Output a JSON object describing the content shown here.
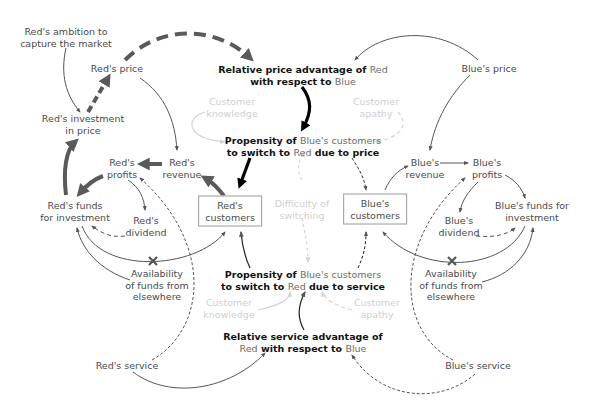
{
  "diagram": {
    "type": "causal-loop-diagram",
    "colors": {
      "text": "#4a4a4a",
      "bold_text": "#111111",
      "faint_text": "#cfcfcf",
      "thick_arrow": "#5a5a5a",
      "black_arrow": "#000000",
      "thin_arrow": "#555555",
      "faint_arrow": "#d0d0d0"
    },
    "nodes": {
      "red_ambition": {
        "line1": "Red's ambition to",
        "line2": "capture the market"
      },
      "red_price": {
        "label": "Red's price"
      },
      "red_investment_price": {
        "line1": "Red's investment",
        "line2": "in price"
      },
      "relative_price": {
        "line1_a": "Relative price advantage of ",
        "line1_b": "Red",
        "line2_a": "with respect to ",
        "line2_b": "Blue"
      },
      "blue_price": {
        "label": "Blue's price"
      },
      "customer_knowledge_top": {
        "line1": "Customer",
        "line2": "knowledge"
      },
      "customer_apathy_top": {
        "line1": "Customer",
        "line2": "apathy"
      },
      "propensity_price": {
        "line1_a": "Propensity of ",
        "line1_b": "Blue's customers",
        "line2_a": "to switch to ",
        "line2_b": "Red",
        "line2_c": " due to price"
      },
      "red_profits": {
        "line1": "Red's",
        "line2": "profits"
      },
      "red_revenue": {
        "line1": "Red's",
        "line2": "revenue"
      },
      "red_funds": {
        "line1": "Red's funds",
        "line2": "for investment"
      },
      "red_dividend": {
        "line1": "Red's",
        "line2": "dividend"
      },
      "red_customers": {
        "line1": "Red's",
        "line2": "customers"
      },
      "difficulty_switching": {
        "line1": "Difficulty of",
        "line2": "switching"
      },
      "blue_customers": {
        "line1": "Blue's",
        "line2": "customers"
      },
      "blue_revenue": {
        "line1": "Blue's",
        "line2": "revenue"
      },
      "blue_profits": {
        "line1": "Blue's",
        "line2": "profits"
      },
      "blue_funds": {
        "line1": "Blue's funds for",
        "line2": "investment"
      },
      "blue_dividend": {
        "line1": "Blue's",
        "line2": "dividend"
      },
      "red_availability": {
        "line1": "Availability",
        "line2": "of funds from",
        "line3": "elsewhere"
      },
      "blue_availability": {
        "line1": "Availability",
        "line2": "of funds from",
        "line3": "elsewhere"
      },
      "propensity_service": {
        "line1_a": "Propensity of ",
        "line1_b": "Blue's customers",
        "line2_a": "to switch to ",
        "line2_b": "Red",
        "line2_c": " due to service"
      },
      "customer_knowledge_bottom": {
        "line1": "Customer",
        "line2": "knowledge"
      },
      "customer_apathy_bottom": {
        "line1": "Customer",
        "line2": "apathy"
      },
      "relative_service": {
        "line1_a": "Relative service advantage of",
        "line2_a": "Red",
        "line2_b": " with respect to ",
        "line2_c": "Blue"
      },
      "red_service": {
        "label": "Red's service"
      },
      "blue_service": {
        "label": "Blue's service"
      }
    }
  }
}
